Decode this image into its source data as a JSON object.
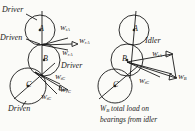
{
  "figure": {
    "type": "engineering-free-body-diagram"
  },
  "left_diagram": {
    "circles": [
      {
        "id": "A",
        "label": "A",
        "cx": 40,
        "cy": 30,
        "r": 15
      },
      {
        "id": "B",
        "label": "B",
        "cx": 44,
        "cy": 60,
        "r": 16
      },
      {
        "id": "C",
        "label": "C",
        "cx": 28,
        "cy": 86,
        "r": 18
      }
    ],
    "annotations": [
      {
        "name": "driver-top",
        "text": "Driver",
        "x": 2,
        "y": 12
      },
      {
        "name": "driven-left",
        "text": "Driven",
        "x": 0,
        "y": 40
      },
      {
        "name": "driver-mid",
        "text": "Driver",
        "x": 61,
        "y": 68
      },
      {
        "name": "driven-bottom",
        "text": "Driven",
        "x": 8,
        "y": 110
      }
    ],
    "force_labels": [
      {
        "name": "force-wta-upper",
        "symbol": "W",
        "sub": "tA",
        "x": 62,
        "y": 28
      },
      {
        "name": "force-wra-right",
        "symbol": "W",
        "sub": "rA",
        "x": 79,
        "y": 41
      },
      {
        "name": "force-wra-lower",
        "symbol": "W",
        "sub": "rA",
        "x": 63,
        "y": 55
      },
      {
        "name": "force-wtc-upper",
        "symbol": "W",
        "sub": "tC",
        "x": 54,
        "y": 80
      },
      {
        "name": "force-wrc-right",
        "symbol": "W",
        "sub": "rC",
        "x": 59,
        "y": 91
      },
      {
        "name": "force-wtc-lower",
        "symbol": "W",
        "sub": "tC",
        "x": 42,
        "y": 98
      }
    ]
  },
  "right_diagram": {
    "circles": [
      {
        "id": "A",
        "label": "A",
        "cx": 134,
        "cy": 30,
        "r": 15
      },
      {
        "id": "B",
        "label": "B",
        "cx": 127,
        "cy": 60,
        "r": 16
      },
      {
        "id": "C",
        "label": "C",
        "cx": 115,
        "cy": 86,
        "r": 17
      }
    ],
    "annotations": [
      {
        "name": "idler-label",
        "text": "Idler",
        "x": 145,
        "y": 42
      }
    ],
    "force_labels": [
      {
        "name": "force-wta",
        "symbol": "W",
        "sub": "tA",
        "x": 153,
        "y": 56
      },
      {
        "name": "force-wb-resultant",
        "symbol": "W",
        "sub": "B",
        "x": 178,
        "y": 80
      },
      {
        "name": "force-wtc",
        "symbol": "W",
        "sub": "tC",
        "x": 140,
        "y": 82
      }
    ],
    "caption": {
      "symbol": "W",
      "sub": "B",
      "line1": " total load on",
      "line2": "bearings from idler"
    }
  },
  "colors": {
    "ink": "#1a1a1a",
    "background": "#fbfbf8"
  }
}
